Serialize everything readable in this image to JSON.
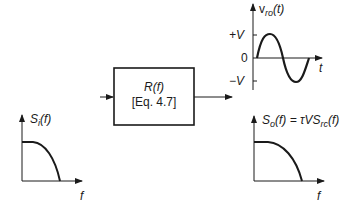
{
  "filter_block": {
    "title": "R(f)",
    "subtitle": "[Eq. 4.7]"
  },
  "input_spectrum": {
    "label": "S_i(f)",
    "label_main": "S",
    "label_sub": "i",
    "label_tail": "(f)",
    "x_axis_label": "f"
  },
  "output_waveform": {
    "label_main": "v",
    "label_sub": "ro",
    "label_tail": "(t)",
    "x_axis_label": "t",
    "y_ticks": [
      "+V",
      "0",
      "−V"
    ]
  },
  "output_spectrum": {
    "label_main": "S",
    "label_sub": "o",
    "label_mid": "(f) = τVS",
    "label_sub2": "rc",
    "label_tail": "(f)",
    "x_axis_label": "f"
  },
  "colors": {
    "line": "#1a1a1a",
    "background": "#ffffff"
  }
}
